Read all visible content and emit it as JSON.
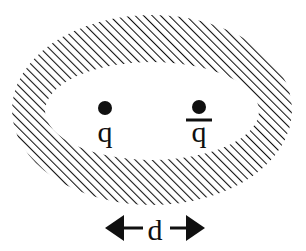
{
  "figure": {
    "background_color": "#ffffff",
    "ink_color": "#101010",
    "width": 306,
    "height": 251
  },
  "shell": {
    "name": "hatched-elliptical-shell",
    "fill_pattern": "diagonal-hatch-45",
    "hatch_angle_deg": 45,
    "hatch_spacing_px": 6,
    "hatch_stroke_width_px": 2.1,
    "hatch_color": "#101010",
    "outer_ellipse": {
      "cx": 152,
      "cy": 110,
      "rx": 140,
      "ry": 95
    },
    "inner_ellipse": {
      "cx": 152,
      "cy": 111,
      "rx": 107,
      "ry": 49
    },
    "interior_fill": "#ffffff"
  },
  "particles": [
    {
      "id": "quark",
      "dot_name": "quark-dot",
      "label_name": "quark-label",
      "label": "q",
      "has_overbar": false,
      "dot": {
        "cx": 105,
        "cy": 108,
        "r": 7
      },
      "label_pos": {
        "x": 105,
        "y": 142
      },
      "label_font_size_px": 30
    },
    {
      "id": "antiquark",
      "dot_name": "antiquark-dot",
      "label_name": "antiquark-label",
      "label": "q",
      "overbar_label": "q̄",
      "has_overbar": true,
      "dot": {
        "cx": 199,
        "cy": 107,
        "r": 7
      },
      "label_pos": {
        "x": 199,
        "y": 142
      },
      "label_font_size_px": 30,
      "overbar": {
        "x1": 186,
        "x2": 212,
        "y": 120,
        "stroke_width_px": 3
      }
    }
  ],
  "separation_measure": {
    "name": "separation-distance",
    "label": "d",
    "label_pos": {
      "x": 155,
      "y": 240
    },
    "label_font_size_px": 30,
    "baseline_y": 228,
    "left_arrow": {
      "name": "left-arrow",
      "direction": "left",
      "tail_x": 143,
      "tip_x": 105,
      "head_length_px": 19,
      "head_half_height_px": 13,
      "shaft_width_px": 3
    },
    "right_arrow": {
      "name": "right-arrow",
      "direction": "right",
      "tail_x": 170,
      "tip_x": 205,
      "head_length_px": 19,
      "head_half_height_px": 13,
      "shaft_width_px": 3
    }
  }
}
